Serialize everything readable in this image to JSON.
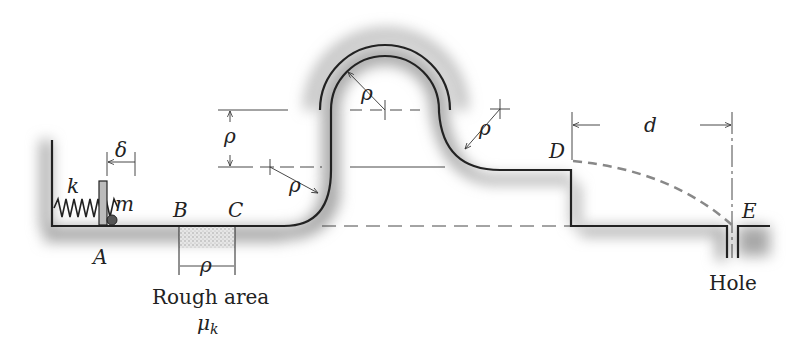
{
  "figure": {
    "type": "mechanics-track-diagram",
    "labels": {
      "spring": "k",
      "mass": "m",
      "compression": "δ",
      "point_a": "A",
      "point_b": "B",
      "point_c": "C",
      "point_d": "D",
      "point_e": "E",
      "radius": "ρ",
      "distance": "d",
      "rough_area": "Rough area",
      "friction": "μ",
      "friction_sub": "k",
      "hole": "Hole"
    },
    "colors": {
      "line": "#222222",
      "shade": "#9a9a9a",
      "trajectory": "#8a8a8a",
      "rough": "#c8c8c8"
    }
  }
}
